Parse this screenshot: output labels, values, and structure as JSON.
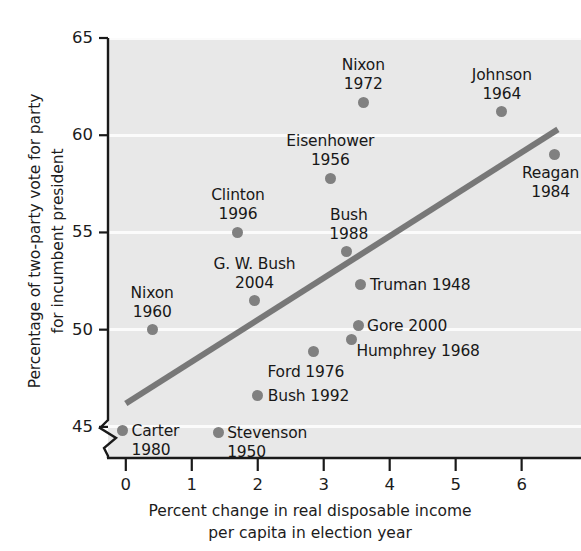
{
  "chart_data": {
    "type": "scatter",
    "title": "",
    "xlabel": "Percent change in real disposable income per capita in election year",
    "xlabel_lines": [
      "Percent change in real disposable income",
      "per capita in election year"
    ],
    "ylabel": "Percentage of two-party vote for party for incumbent president",
    "ylabel_lines": [
      "Percentage of two-party vote for party",
      "for incumbent president"
    ],
    "xlim": [
      -0.27,
      6.9
    ],
    "ylim": [
      43.4,
      65.0
    ],
    "xticks": [
      0,
      1,
      2,
      3,
      4,
      5,
      6
    ],
    "xtick_labels": [
      "0",
      "1",
      "2",
      "3",
      "4",
      "5",
      "6"
    ],
    "yticks": [
      45,
      50,
      55,
      60,
      65
    ],
    "ytick_labels": [
      "45",
      "50",
      "55",
      "60",
      "65"
    ],
    "grid": "horizontal-white-bands",
    "y_axis_break": true,
    "legend": "none",
    "panel_color": "#e8e8e8",
    "grid_color": "#fbfbfb",
    "marker_color": "#808080",
    "trendline_color": "#787878",
    "points": [
      {
        "name": "Carter",
        "year": "1980",
        "x": -0.05,
        "y": 44.8,
        "label_lines": [
          "Carter",
          "1980"
        ],
        "label_align": "left",
        "dx": 9,
        "dy": -9
      },
      {
        "name": "Stevenson",
        "year": "1950",
        "x": 1.4,
        "y": 44.7,
        "label_lines": [
          "Stevenson",
          "1950"
        ],
        "label_align": "left",
        "dx": 9,
        "dy": -9
      },
      {
        "name": "Bush",
        "year": "1992",
        "x": 2.0,
        "y": 46.6,
        "label_lines": [
          "Bush 1992"
        ],
        "label_align": "left",
        "dx": 10,
        "dy": -9
      },
      {
        "name": "Ford",
        "year": "1976",
        "x": 2.85,
        "y": 48.9,
        "label_lines": [
          "Ford 1976"
        ],
        "label_align": "center",
        "dx": -8,
        "dy": 12
      },
      {
        "name": "Humphrey",
        "year": "1968",
        "x": 3.42,
        "y": 49.5,
        "label_lines": [
          "Humphrey 1968"
        ],
        "label_align": "left",
        "dx": 5,
        "dy": 3
      },
      {
        "name": "Gore",
        "year": "2000",
        "x": 3.52,
        "y": 50.2,
        "label_lines": [
          "Gore 2000"
        ],
        "label_align": "left",
        "dx": 9,
        "dy": -9
      },
      {
        "name": "Nixon",
        "year": "1960",
        "x": 0.4,
        "y": 50.0,
        "label_lines": [
          "Nixon",
          "1960"
        ],
        "label_align": "center",
        "dx": 0,
        "dy": -46
      },
      {
        "name": "Truman",
        "year": "1948",
        "x": 3.55,
        "y": 52.3,
        "label_lines": [
          "Truman 1948"
        ],
        "label_align": "left",
        "dx": 10,
        "dy": -9
      },
      {
        "name": "G. W. Bush",
        "year": "2004",
        "x": 1.95,
        "y": 51.5,
        "label_lines": [
          "G. W. Bush",
          "2004"
        ],
        "label_align": "center",
        "dx": 0,
        "dy": -46
      },
      {
        "name": "Bush",
        "year": "1988",
        "x": 3.35,
        "y": 54.0,
        "label_lines": [
          "Bush",
          "1988"
        ],
        "label_align": "center",
        "dx": 2,
        "dy": -46
      },
      {
        "name": "Clinton",
        "year": "1996",
        "x": 1.7,
        "y": 55.0,
        "label_lines": [
          "Clinton",
          "1996"
        ],
        "label_align": "center",
        "dx": 0,
        "dy": -46
      },
      {
        "name": "Eisenhower",
        "year": "1956",
        "x": 3.1,
        "y": 57.8,
        "label_lines": [
          "Eisenhower",
          "1956"
        ],
        "label_align": "center",
        "dx": 0,
        "dy": -46
      },
      {
        "name": "Reagan",
        "year": "1984",
        "x": 6.5,
        "y": 59.0,
        "label_lines": [
          "Reagan",
          "1984"
        ],
        "label_align": "center",
        "dx": -4,
        "dy": 9
      },
      {
        "name": "Johnson",
        "year": "1964",
        "x": 5.7,
        "y": 61.2,
        "label_lines": [
          "Johnson",
          "1964"
        ],
        "label_align": "center",
        "dx": 0,
        "dy": -46
      },
      {
        "name": "Nixon",
        "year": "1972",
        "x": 3.6,
        "y": 61.7,
        "label_lines": [
          "Nixon",
          "1972"
        ],
        "label_align": "center",
        "dx": 0,
        "dy": -46
      }
    ],
    "trendline": {
      "x0": 0.0,
      "y0": 46.2,
      "x1": 6.55,
      "y1": 60.3
    }
  }
}
